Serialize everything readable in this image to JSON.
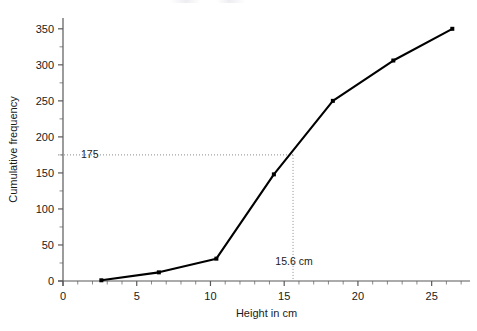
{
  "chart_data": {
    "type": "line",
    "title": "",
    "subtitle": "",
    "xlabel": "Height in cm",
    "ylabel": "Cumulative frequency",
    "xlim": [
      0,
      27.6
    ],
    "ylim": [
      0,
      365
    ],
    "x_tick_step_major": 5,
    "x_tick_step_minor": 1,
    "y_tick_step_major": 50,
    "y_tick_step_minor": 25,
    "x_tick_labels": [
      "0",
      "5",
      "10",
      "15",
      "20",
      "25"
    ],
    "x_tick_values": [
      0,
      5,
      10,
      15,
      20,
      25
    ],
    "y_tick_labels": [
      "0",
      "50",
      "100",
      "150",
      "200",
      "250",
      "300",
      "350"
    ],
    "y_tick_values": [
      0,
      50,
      100,
      150,
      200,
      250,
      300,
      350
    ],
    "grid": false,
    "legend": "none",
    "series": [
      {
        "name": "Cumulative frequency",
        "x": [
          2.6,
          6.5,
          10.4,
          14.3,
          18.3,
          22.4,
          26.4
        ],
        "values": [
          1,
          12,
          31,
          148,
          250,
          306,
          350
        ],
        "color": "#000000",
        "marker": "square"
      }
    ],
    "annotations": [
      {
        "name": "median-horizontal-guide",
        "type": "hline",
        "value": 175,
        "label": "175",
        "from_x": 0,
        "to_x": 15.6
      },
      {
        "name": "median-vertical-guide",
        "type": "vline",
        "value": 15.6,
        "label": "15.6 cm",
        "from_y": 0,
        "to_y": 175
      }
    ]
  }
}
